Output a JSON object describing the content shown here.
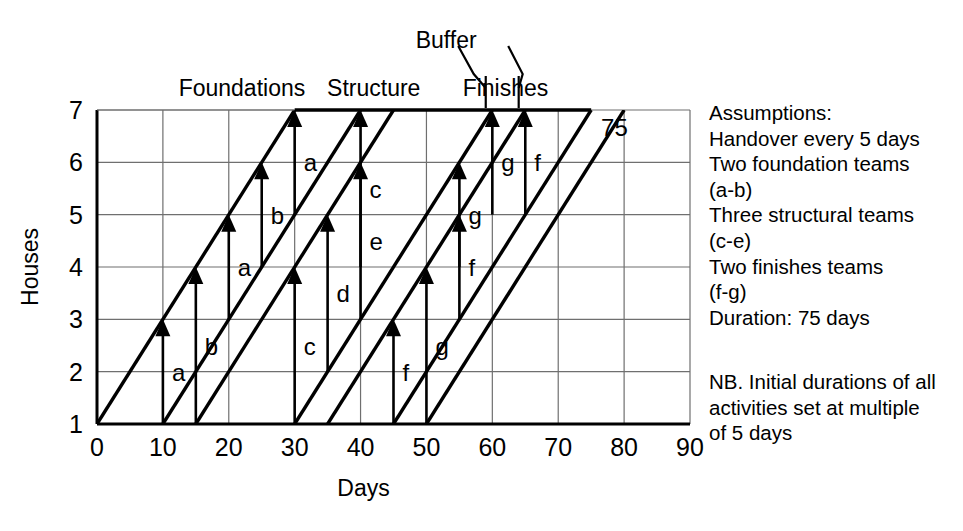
{
  "chart_data": {
    "type": "line",
    "title": "",
    "xlabel": "Days",
    "ylabel": "Houses",
    "xlim": [
      0,
      90
    ],
    "ylim": [
      1,
      7
    ],
    "xticks": [
      0,
      10,
      20,
      30,
      40,
      50,
      60,
      70,
      80,
      90
    ],
    "yticks": [
      1,
      2,
      3,
      4,
      5,
      6,
      7
    ],
    "grid": true,
    "legend": "none",
    "end_annotation": "75",
    "phase_labels": [
      {
        "text": "Foundations",
        "x_day": 22
      },
      {
        "text": "Structure",
        "x_day": 42
      },
      {
        "text": "Finishes",
        "x_day": 62
      },
      {
        "text": "Buffer",
        "x_day": 53
      }
    ],
    "buffer_ticks_days": [
      59,
      64
    ],
    "flow_lines": [
      {
        "phase": "Foundations",
        "team": "a",
        "start_day": 0,
        "end_day": 30,
        "start_house": 1,
        "end_house": 7
      },
      {
        "phase": "Foundations",
        "team": "b",
        "start_day": 10,
        "end_day": 40,
        "start_house": 1,
        "end_house": 7
      },
      {
        "phase": "Structure",
        "team": "c",
        "start_day": 15,
        "end_day": 45,
        "start_house": 1,
        "end_house": 7
      },
      {
        "phase": "Structure",
        "team": "d",
        "start_day": 30,
        "end_day": 60,
        "start_house": 1,
        "end_house": 7
      },
      {
        "phase": "Structure",
        "team": "e",
        "start_day": 35,
        "end_day": 65,
        "start_house": 1,
        "end_house": 7
      },
      {
        "phase": "Finishes",
        "team": "f",
        "start_day": 45,
        "end_day": 75,
        "start_house": 1,
        "end_house": 7
      },
      {
        "phase": "Finishes",
        "team": "g",
        "start_day": 50,
        "end_day": 80,
        "start_house": 1,
        "end_house": 7
      }
    ],
    "top_edge": {
      "from_day": 30,
      "to_day": 75,
      "house": 7
    },
    "activities": [
      {
        "label": "a",
        "day": 10,
        "from_house": 1,
        "to_house": 3
      },
      {
        "label": "b",
        "day": 15,
        "from_house": 1,
        "to_house": 4
      },
      {
        "label": "a",
        "day": 20,
        "from_house": 3,
        "to_house": 5
      },
      {
        "label": "b",
        "day": 25,
        "from_house": 4,
        "to_house": 6
      },
      {
        "label": "c",
        "day": 30,
        "from_house": 1,
        "to_house": 4
      },
      {
        "label": "a",
        "day": 30,
        "from_house": 5,
        "to_house": 7
      },
      {
        "label": "d",
        "day": 35,
        "from_house": 2,
        "to_house": 5
      },
      {
        "label": "e",
        "day": 40,
        "from_house": 3,
        "to_house": 6
      },
      {
        "label": "c",
        "day": 40,
        "from_house": 4,
        "to_house": 7
      },
      {
        "label": "f",
        "day": 45,
        "from_house": 1,
        "to_house": 3
      },
      {
        "label": "g",
        "day": 50,
        "from_house": 1,
        "to_house": 4
      },
      {
        "label": "f",
        "day": 55,
        "from_house": 3,
        "to_house": 5
      },
      {
        "label": "g",
        "day": 55,
        "from_house": 4,
        "to_house": 6
      },
      {
        "label": "g",
        "day": 60,
        "from_house": 5,
        "to_house": 7
      },
      {
        "label": "f",
        "day": 65,
        "from_house": 5,
        "to_house": 7
      }
    ]
  },
  "axes": {
    "x_title": "Days",
    "y_title": "Houses",
    "x_tick_labels": [
      "0",
      "10",
      "20",
      "30",
      "40",
      "50",
      "60",
      "70",
      "80",
      "90"
    ],
    "y_tick_labels": [
      "1",
      "2",
      "3",
      "4",
      "5",
      "6",
      "7"
    ]
  },
  "annotations": {
    "end_duration": "75",
    "foundations": "Foundations",
    "structure": "Structure",
    "finishes": "Finishes",
    "buffer": "Buffer"
  },
  "sidebar": {
    "assumptions": "Assumptions:\nHandover every 5 days\nTwo foundation teams\n(a-b)\nThree structural teams\n(c-e)\nTwo finishes teams\n(f-g)\nDuration: 75 days",
    "note": "NB. Initial durations of all\nactivities set at multiple\nof 5 days"
  },
  "colors": {
    "ink": "#000000",
    "grid": "#6f6f6f",
    "background": "#ffffff"
  }
}
